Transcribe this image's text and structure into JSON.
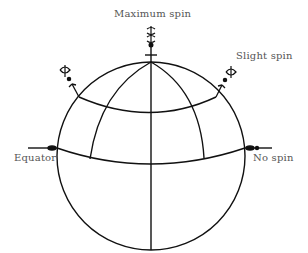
{
  "diagram": {
    "labels": {
      "maximum_spin": "Maximum spin",
      "slight_spin": "Slight spin",
      "equator": "Equator",
      "no_spin": "No spin"
    },
    "elements": [
      {
        "name": "globe",
        "shape": "circle"
      },
      {
        "name": "equator-line",
        "shape": "curve"
      },
      {
        "name": "mid-latitude-line",
        "shape": "curve"
      },
      {
        "name": "central-meridian",
        "shape": "line"
      },
      {
        "name": "left-meridian",
        "shape": "curve"
      },
      {
        "name": "right-meridian",
        "shape": "curve"
      },
      {
        "name": "pole-pendulum",
        "spin": "maximum"
      },
      {
        "name": "mid-latitude-pendulums",
        "spin": "slight"
      },
      {
        "name": "equator-pendulums",
        "spin": "none"
      }
    ],
    "colors": {
      "stroke": "#111111",
      "label": "#555555",
      "background": "#ffffff"
    }
  }
}
